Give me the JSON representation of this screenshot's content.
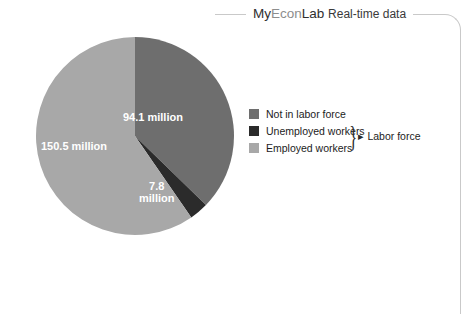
{
  "header": {
    "brand_prefix": "My",
    "brand_mid": "Econ",
    "brand_suffix": "Lab",
    "subtitle": "Real-time data"
  },
  "colors": {
    "not_in_labor_force": "#6e6e6e",
    "unemployed_workers": "#2b2b2b",
    "employed_workers": "#a8a8a8",
    "background": "#ffffff",
    "border": "#c9c9c9",
    "label_text": "#ffffff"
  },
  "legend": {
    "items": [
      {
        "label": "Not in labor force",
        "color": "#6e6e6e"
      },
      {
        "label": "Unemployed workers",
        "color": "#2b2b2b"
      },
      {
        "label": "Employed workers",
        "color": "#a8a8a8"
      }
    ],
    "group_label": "Labor force"
  },
  "pie_labels": {
    "not_in_labor_force": "94.1 million",
    "employed_workers": "150.5 million",
    "unemployed_line1": "7.8",
    "unemployed_line2": "million"
  },
  "chart_data": {
    "type": "pie",
    "title": "",
    "categories": [
      "Not in labor force",
      "Unemployed workers",
      "Employed workers"
    ],
    "values": [
      94.1,
      7.8,
      150.5
    ],
    "value_labels": [
      "94.1 million",
      "7.8 million",
      "150.5 million"
    ],
    "units": "millions of people",
    "total": 252.4,
    "colors": [
      "#6e6e6e",
      "#2b2b2b",
      "#a8a8a8"
    ],
    "start_angle_deg": 0,
    "direction": "clockwise",
    "legend_position": "right",
    "grid": false,
    "annotations": [
      {
        "text": "Labor force",
        "covers": [
          "Unemployed workers",
          "Employed workers"
        ]
      }
    ]
  }
}
